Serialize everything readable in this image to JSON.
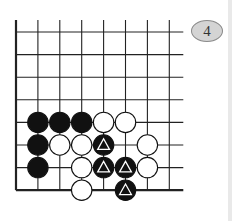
{
  "diagram": {
    "label": "4",
    "grid": {
      "cols": 8,
      "rows": 8,
      "x_start": 16,
      "y_start": 32,
      "spacing_x": 21.9,
      "spacing_y": 22.6,
      "line_color": "#222222",
      "extend_top": 12,
      "extend_right": 14
    },
    "stones": [
      {
        "color": "black",
        "col": 1,
        "row": 4,
        "marked": false
      },
      {
        "color": "black",
        "col": 2,
        "row": 4,
        "marked": false
      },
      {
        "color": "black",
        "col": 3,
        "row": 4,
        "marked": false
      },
      {
        "color": "white",
        "col": 4,
        "row": 4,
        "marked": false
      },
      {
        "color": "white",
        "col": 5,
        "row": 4,
        "marked": false
      },
      {
        "color": "black",
        "col": 1,
        "row": 5,
        "marked": false
      },
      {
        "color": "white",
        "col": 2,
        "row": 5,
        "marked": false
      },
      {
        "color": "white",
        "col": 3,
        "row": 5,
        "marked": false
      },
      {
        "color": "black",
        "col": 4,
        "row": 5,
        "marked": true
      },
      {
        "color": "white",
        "col": 6,
        "row": 5,
        "marked": false
      },
      {
        "color": "black",
        "col": 1,
        "row": 6,
        "marked": false
      },
      {
        "color": "white",
        "col": 3,
        "row": 6,
        "marked": false
      },
      {
        "color": "black",
        "col": 4,
        "row": 6,
        "marked": true
      },
      {
        "color": "black",
        "col": 5,
        "row": 6,
        "marked": true
      },
      {
        "color": "white",
        "col": 6,
        "row": 6,
        "marked": false
      },
      {
        "color": "white",
        "col": 3,
        "row": 7,
        "marked": false
      },
      {
        "color": "black",
        "col": 5,
        "row": 7,
        "marked": true
      }
    ],
    "marker": "triangle-icon"
  }
}
